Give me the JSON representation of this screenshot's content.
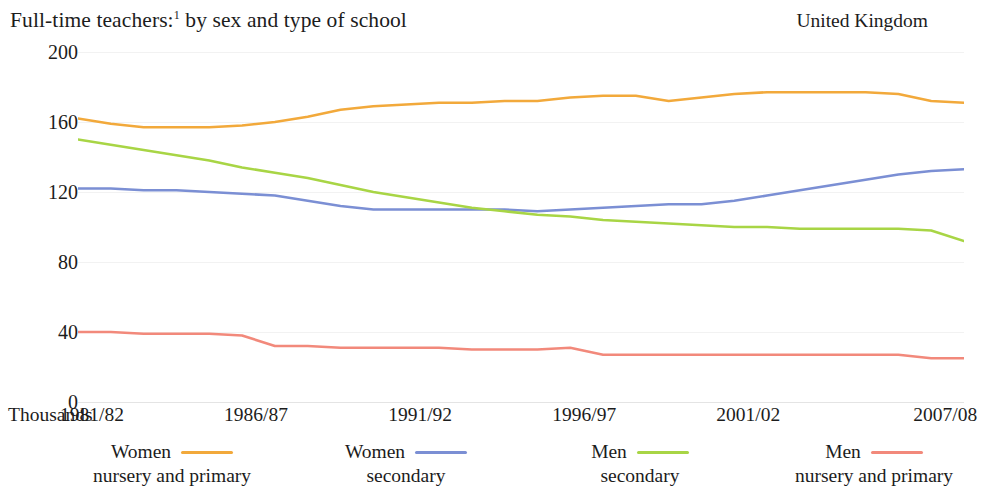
{
  "header": {
    "title": "Full-time teachers:",
    "title_footnote": "1",
    "title_rest": " by sex and type of school",
    "region": "United Kingdom"
  },
  "chart_data": {
    "type": "line",
    "title": "Full-time teachers:1 by sex and type of school",
    "subtitle": "United Kingdom",
    "xlabel": "",
    "ylabel": "Thousands",
    "unit_label": "Thousands",
    "grid": true,
    "legend_position": "bottom",
    "ylim": [
      0,
      200
    ],
    "yticks": [
      200,
      160,
      120,
      80,
      40,
      0
    ],
    "xtick_labels": [
      "1981/82",
      "1986/87",
      "1991/92",
      "1996/97",
      "2001/02",
      "2007/08"
    ],
    "xtick_positions": [
      1981,
      1986,
      1991,
      1996,
      2001,
      2007
    ],
    "x": [
      1981,
      1982,
      1983,
      1984,
      1985,
      1986,
      1987,
      1988,
      1989,
      1990,
      1991,
      1992,
      1993,
      1994,
      1995,
      1996,
      1997,
      1998,
      1999,
      2000,
      2001,
      2002,
      2003,
      2004,
      2005,
      2006,
      2007,
      2008
    ],
    "series": [
      {
        "name": "Women nursery and primary",
        "color": "#F2A93B",
        "values": [
          162,
          159,
          157,
          157,
          157,
          158,
          160,
          163,
          167,
          169,
          170,
          171,
          171,
          172,
          172,
          174,
          175,
          175,
          172,
          174,
          176,
          177,
          177,
          177,
          177,
          176,
          172,
          171
        ]
      },
      {
        "name": "Women secondary",
        "color": "#7B8FD4",
        "values": [
          122,
          122,
          121,
          121,
          120,
          119,
          118,
          115,
          112,
          110,
          110,
          110,
          110,
          110,
          109,
          110,
          111,
          112,
          113,
          113,
          115,
          118,
          121,
          124,
          127,
          130,
          132,
          133
        ]
      },
      {
        "name": "Men secondary",
        "color": "#A8D545",
        "values": [
          150,
          147,
          144,
          141,
          138,
          134,
          131,
          128,
          124,
          120,
          117,
          114,
          111,
          109,
          107,
          106,
          104,
          103,
          102,
          101,
          100,
          100,
          99,
          99,
          99,
          99,
          98,
          92
        ]
      },
      {
        "name": "Men nursery and primary",
        "color": "#F2897B",
        "values": [
          40,
          40,
          39,
          39,
          39,
          38,
          32,
          32,
          31,
          31,
          31,
          31,
          30,
          30,
          30,
          31,
          27,
          27,
          27,
          27,
          27,
          27,
          27,
          27,
          27,
          27,
          25,
          25
        ]
      }
    ]
  },
  "axis": {
    "y_ticks": [
      "200",
      "160",
      "120",
      "80",
      "40",
      "0"
    ],
    "x_unit": "Thousands",
    "x_ticks": [
      "1981/82",
      "1986/87",
      "1991/92",
      "1996/97",
      "2001/02",
      "2007/08"
    ]
  },
  "legend": {
    "items": [
      {
        "name": "Women",
        "sub": "nursery and primary",
        "color": "#F2A93B"
      },
      {
        "name": "Women",
        "sub": "secondary",
        "color": "#7B8FD4"
      },
      {
        "name": "Men",
        "sub": "secondary",
        "color": "#A8D545"
      },
      {
        "name": "Men",
        "sub": "nursery and primary",
        "color": "#F2897B"
      }
    ]
  }
}
